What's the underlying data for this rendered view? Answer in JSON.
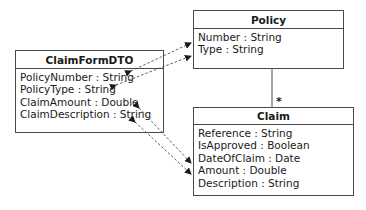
{
  "diagram": {
    "classes": {
      "claim_form_dto": {
        "name": "ClaimFormDTO",
        "attributes": [
          "PolicyNumber : String",
          "PolicyType : String",
          "ClaimAmount : Double",
          "ClaimDescription : String"
        ]
      },
      "policy": {
        "name": "Policy",
        "attributes": [
          "Number : String",
          "Type : String"
        ]
      },
      "claim": {
        "name": "Claim",
        "attributes": [
          "Reference : String",
          "IsApproved : Boolean",
          "DateOfClaim : Date",
          "Amount : Double",
          "Description : String"
        ]
      }
    },
    "associations": [
      {
        "from": "Policy",
        "to": "Claim",
        "multiplicity_to": "*"
      }
    ],
    "mappings": [
      {
        "from": "ClaimFormDTO.PolicyNumber",
        "to": "Policy.Number",
        "style": "dashed-bidirectional"
      },
      {
        "from": "ClaimFormDTO.PolicyType",
        "to": "Policy.Type",
        "style": "dashed-bidirectional"
      },
      {
        "from": "ClaimFormDTO.ClaimAmount",
        "to": "Claim.DateOfClaim",
        "style": "dashed-bidirectional"
      },
      {
        "from": "ClaimFormDTO.ClaimDescription",
        "to": "Claim.Amount",
        "style": "dashed-bidirectional"
      }
    ],
    "colors": {
      "line": "#4a4a4a",
      "text": "#1a1a1a",
      "background": "#ffffff"
    }
  }
}
